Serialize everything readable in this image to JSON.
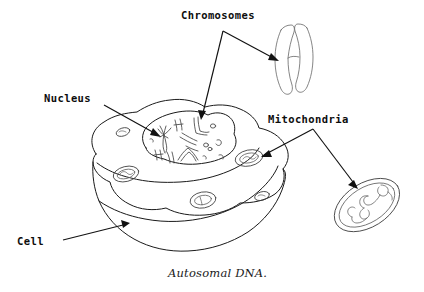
{
  "figure": {
    "caption": "Autosomal DNA.",
    "background_color": "#ffffff",
    "ink_color": "#1a1a1a",
    "width": 424,
    "height": 292
  },
  "labels": {
    "chromosomes": "Chromosomes",
    "nucleus": "Nucleus",
    "mitochondria": "Mitochondria",
    "cell": "Cell"
  },
  "parts": {
    "cell_body": "cell-body",
    "cell_membrane": "cell-membrane",
    "nucleus_body": "nucleus",
    "nuclear_chromosomes": "chromosomes-in-nucleus",
    "cytoplasmic_mitochondria": "mitochondria-in-cytoplasm",
    "magnified_chromosome": "magnified-chromosome",
    "magnified_mitochondrion": "magnified-mitochondrion",
    "mitochondrial_dna": "mitochondrial-dna-loop"
  },
  "leaders": [
    {
      "name": "chromosomes-to-magnified",
      "from_label": "Chromosomes",
      "target": "magnified-chromosome"
    },
    {
      "name": "chromosomes-to-nucleus",
      "from_label": "Chromosomes",
      "target": "chromosomes-in-nucleus"
    },
    {
      "name": "nucleus-to-nucleus",
      "from_label": "Nucleus",
      "target": "nucleus"
    },
    {
      "name": "mitochondria-to-cell-organelle",
      "from_label": "Mitochondria",
      "target": "mitochondria-in-cytoplasm"
    },
    {
      "name": "mitochondria-to-magnified",
      "from_label": "Mitochondria",
      "target": "magnified-mitochondrion"
    },
    {
      "name": "cell-to-membrane",
      "from_label": "Cell",
      "target": "cell-membrane"
    }
  ]
}
